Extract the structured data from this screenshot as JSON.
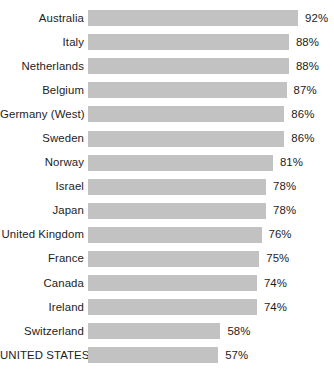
{
  "chart_data": {
    "type": "bar",
    "title": "",
    "subtitle": "",
    "xlabel": "",
    "ylabel": "",
    "orientation": "horizontal",
    "grid": false,
    "legend": false,
    "xlim": [
      0,
      100
    ],
    "value_suffix": "%",
    "bar_color": "#c2c2c2",
    "text_color": "#1c1c1c",
    "background_color": "#ffffff",
    "categories": [
      "Australia",
      "Italy",
      "Netherlands",
      "Belgium",
      "Germany (West)",
      "Sweden",
      "Norway",
      "Israel",
      "Japan",
      "United Kingdom",
      "France",
      "Canada",
      "Ireland",
      "Switzerland",
      "UNITED STATES"
    ],
    "values": [
      92,
      88,
      88,
      87,
      86,
      86,
      81,
      78,
      78,
      76,
      75,
      74,
      74,
      58,
      57
    ],
    "value_labels": [
      "92%",
      "88%",
      "88%",
      "87%",
      "86%",
      "86%",
      "81%",
      "78%",
      "78%",
      "76%",
      "75%",
      "74%",
      "74%",
      "58%",
      "57%"
    ],
    "rows": [
      {
        "label": "Australia",
        "value": 92,
        "value_label": "92%"
      },
      {
        "label": "Italy",
        "value": 88,
        "value_label": "88%"
      },
      {
        "label": "Netherlands",
        "value": 88,
        "value_label": "88%"
      },
      {
        "label": "Belgium",
        "value": 87,
        "value_label": "87%"
      },
      {
        "label": "Germany (West)",
        "value": 86,
        "value_label": "86%"
      },
      {
        "label": "Sweden",
        "value": 86,
        "value_label": "86%"
      },
      {
        "label": "Norway",
        "value": 81,
        "value_label": "81%"
      },
      {
        "label": "Israel",
        "value": 78,
        "value_label": "78%"
      },
      {
        "label": "Japan",
        "value": 78,
        "value_label": "78%"
      },
      {
        "label": "United Kingdom",
        "value": 76,
        "value_label": "76%"
      },
      {
        "label": "France",
        "value": 75,
        "value_label": "75%"
      },
      {
        "label": "Canada",
        "value": 74,
        "value_label": "74%"
      },
      {
        "label": "Ireland",
        "value": 74,
        "value_label": "74%"
      },
      {
        "label": "Switzerland",
        "value": 58,
        "value_label": "58%"
      },
      {
        "label": "UNITED STATES",
        "value": 57,
        "value_label": "57%"
      }
    ]
  },
  "layout": {
    "bar_px_per_unit": 2.283,
    "bar_origin_x": 90
  }
}
